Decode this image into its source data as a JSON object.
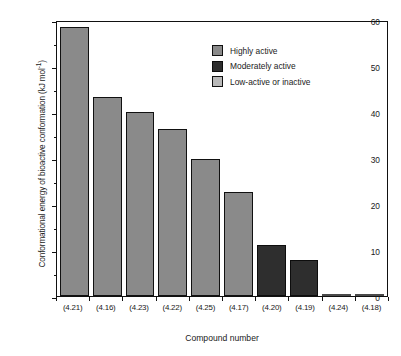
{
  "chart_data": {
    "type": "bar",
    "title": "",
    "xlabel": "Compound number",
    "ylabel": "Conformational energy of bioactive conformation (kJ mol",
    "ylabel_sup": "-1",
    "ylabel_suffix": ")",
    "ylim": [
      0,
      60
    ],
    "yticks": [
      0,
      10,
      20,
      30,
      40,
      50,
      60
    ],
    "ytick_labels": [
      "0",
      "10",
      "20",
      "30",
      "40",
      "50",
      "60"
    ],
    "yminor_ticks": [
      5,
      15,
      25,
      35,
      45,
      55
    ],
    "grid": false,
    "categories": [
      "(4.21)",
      "(4.16)",
      "(4.23)",
      "(4.22)",
      "(4.25)",
      "(4.17)",
      "(4.20)",
      "(4.19)",
      "(4.24)",
      "(4.18)"
    ],
    "values": [
      58.5,
      43.3,
      40.0,
      36.2,
      29.8,
      22.6,
      11.1,
      7.8,
      0.4,
      0.3
    ],
    "bar_classes": [
      "highly",
      "highly",
      "highly",
      "highly",
      "highly",
      "highly",
      "moderate",
      "moderate",
      "lowactive",
      "lowactive"
    ],
    "legend_position": "upper-right-inside",
    "legend": [
      {
        "label": "Highly active",
        "color": "#8a8a8a",
        "key": "highly"
      },
      {
        "label": "Moderately active",
        "color": "#2e2e2e",
        "key": "moderate"
      },
      {
        "label": "Low-active or inactive",
        "color": "#b9b9b9",
        "key": "lowactive"
      }
    ],
    "colors": {
      "highly_active": "#8a8a8a",
      "moderately_active": "#2e2e2e",
      "low_active": "#f2f2f2",
      "axis": "#111111",
      "background": "#ffffff"
    }
  }
}
